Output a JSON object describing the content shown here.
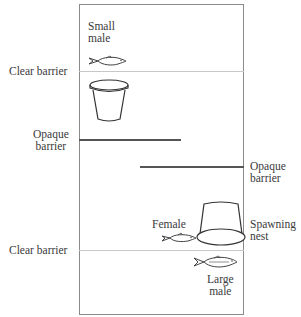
{
  "diagram": {
    "labels": {
      "small_male": [
        "Small",
        "male"
      ],
      "clear_barrier_top": "Clear barrier",
      "opaque_barrier_left": [
        "Opaque",
        "barrier"
      ],
      "opaque_barrier_right": [
        "Opaque",
        "barrier"
      ],
      "female": "Female",
      "spawning_nest": [
        "Spawning",
        "nest"
      ],
      "clear_barrier_bottom": "Clear barrier",
      "large_male": [
        "Large",
        "male"
      ]
    },
    "icons": {
      "small_fish": "fish-icon",
      "flowerpot": "flowerpot-icon",
      "spawning_nest": "inverted-pot-icon",
      "female_fish": "fish-icon",
      "large_fish": "fish-icon"
    },
    "colors": {
      "tank_border": "#8a8a8a",
      "clear_barrier": "#c8c8c8",
      "opaque_barrier": "#555555",
      "text": "#3a3a3a"
    }
  }
}
